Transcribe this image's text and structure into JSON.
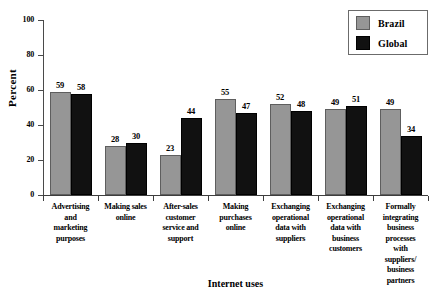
{
  "chart_data": {
    "type": "bar",
    "title": "",
    "subtitle": "",
    "xlabel": "Internet uses",
    "ylabel": "Percent",
    "ylim": [
      0,
      100
    ],
    "yticks": [
      0,
      20,
      40,
      60,
      80,
      100
    ],
    "ytick_labels": [
      "0",
      "20",
      "40",
      "60",
      "80",
      "100"
    ],
    "grid": false,
    "legend_position": "top-right",
    "categories": [
      "Advertising and marketing purposes",
      "Making sales online",
      "After-sales customer service and support",
      "Making purchases online",
      "Exchanging operational data with suppliers",
      "Exchanging operational data with business customers",
      "Formally integrating business processes with suppliers/ business partners"
    ],
    "category_lines": [
      [
        "Advertising",
        "and",
        "marketing",
        "purposes"
      ],
      [
        "Making sales",
        "online"
      ],
      [
        "After-sales",
        "customer",
        "service and",
        "support"
      ],
      [
        "Making",
        "purchases",
        "online"
      ],
      [
        "Exchanging",
        "operational",
        "data with",
        "suppliers"
      ],
      [
        "Exchanging",
        "operational",
        "data with",
        "business",
        "customers"
      ],
      [
        "Formally",
        "integrating",
        "business",
        "processes",
        "with",
        "suppliers/",
        "business",
        "partners"
      ]
    ],
    "series": [
      {
        "name": "Brazil",
        "color": "#969696",
        "values": [
          59,
          28,
          23,
          55,
          52,
          49,
          49
        ]
      },
      {
        "name": "Global",
        "color": "#111111",
        "values": [
          58,
          30,
          44,
          47,
          48,
          51,
          34
        ]
      }
    ]
  },
  "legend": {
    "items": [
      {
        "label": "Brazil",
        "swatch": "brazil-swatch"
      },
      {
        "label": "Global",
        "swatch": "global-swatch"
      }
    ]
  }
}
